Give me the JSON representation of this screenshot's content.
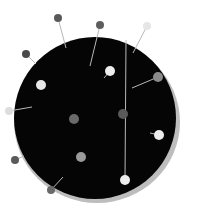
{
  "image": {
    "subject": "pin cushion with pins, grayscale",
    "background": "#ffffff",
    "cushion": {
      "cx": 95,
      "cy": 118,
      "r": 81,
      "color": "#050505",
      "rim": "#bdbdbd"
    },
    "pins": [
      {
        "head": [
          58,
          18
        ],
        "tail": [
          66,
          48
        ],
        "r": 4,
        "shade": "#5a5a5a"
      },
      {
        "head": [
          100,
          25
        ],
        "tail": [
          90,
          66
        ],
        "r": 4,
        "shade": "#5e5e5e"
      },
      {
        "head": [
          147,
          26
        ],
        "tail": [
          133,
          53
        ],
        "r": 4,
        "shade": "#e6e6e6"
      },
      {
        "head": [
          26,
          54
        ],
        "tail": [
          36,
          64
        ],
        "r": 4,
        "shade": "#4a4a4a"
      },
      {
        "head": [
          110,
          71
        ],
        "tail": [
          104,
          78
        ],
        "r": 5,
        "shade": "#eeeeee"
      },
      {
        "head": [
          41,
          85
        ],
        "tail": [
          41,
          85
        ],
        "r": 5,
        "shade": "#e8e8e8"
      },
      {
        "head": [
          158,
          77
        ],
        "tail": [
          132,
          88
        ],
        "r": 5,
        "shade": "#8a8a8a"
      },
      {
        "head": [
          9,
          111
        ],
        "tail": [
          32,
          107
        ],
        "r": 4,
        "shade": "#dddddd"
      },
      {
        "head": [
          74,
          119
        ],
        "tail": [
          74,
          119
        ],
        "r": 5,
        "shade": "#6a6a6a"
      },
      {
        "head": [
          123,
          114
        ],
        "tail": [
          123,
          114
        ],
        "r": 5,
        "shade": "#5a5a5a"
      },
      {
        "head": [
          159,
          135
        ],
        "tail": [
          150,
          133
        ],
        "r": 5,
        "shade": "#eeeeee"
      },
      {
        "head": [
          81,
          157
        ],
        "tail": [
          81,
          157
        ],
        "r": 5,
        "shade": "#9a9a9a"
      },
      {
        "head": [
          15,
          160
        ],
        "tail": [
          24,
          156
        ],
        "r": 4,
        "shade": "#5a5a5a"
      },
      {
        "head": [
          51,
          190
        ],
        "tail": [
          63,
          177
        ],
        "r": 4,
        "shade": "#6a6a6a"
      },
      {
        "head": [
          125,
          180
        ],
        "tail": [
          126,
          40
        ],
        "r": 5,
        "shade": "#eeeeee"
      }
    ]
  }
}
